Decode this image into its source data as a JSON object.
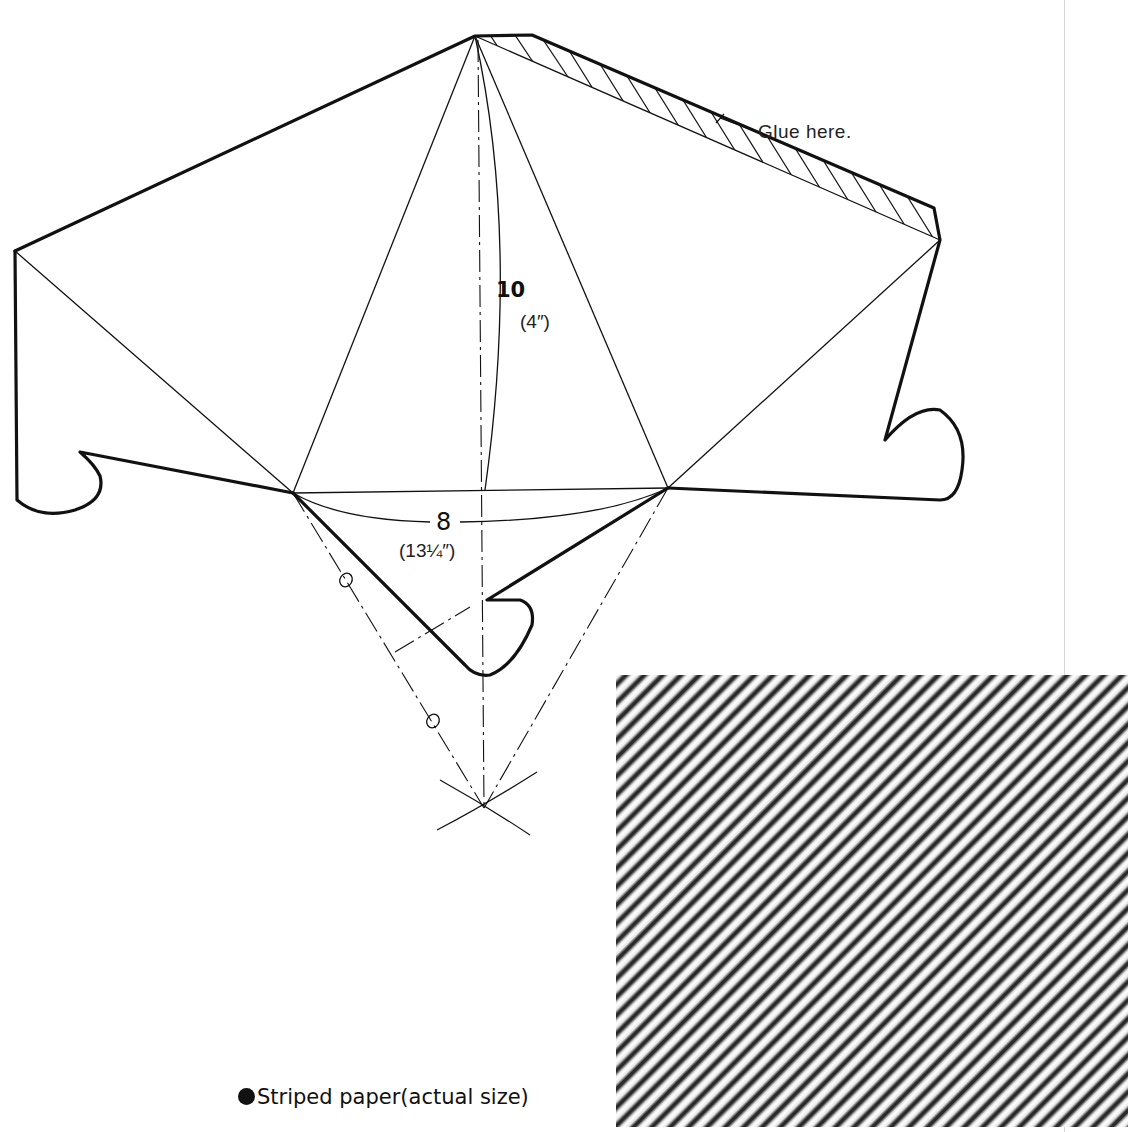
{
  "diagram": {
    "type": "papercraft-template",
    "annotations": {
      "glue": "Glue here.",
      "height_dim": "10",
      "height_dim_inches": "(4″)",
      "base_dim": "8",
      "base_dim_inches": "(13¼″)"
    },
    "caption": {
      "bullet": "●",
      "text": "Striped paper(actual size)"
    },
    "colors": {
      "ink": "#111111",
      "stripe_dark": "#2a2a2a",
      "stripe_light": "#ffffff",
      "page_edge": "#d6d6d6"
    }
  }
}
